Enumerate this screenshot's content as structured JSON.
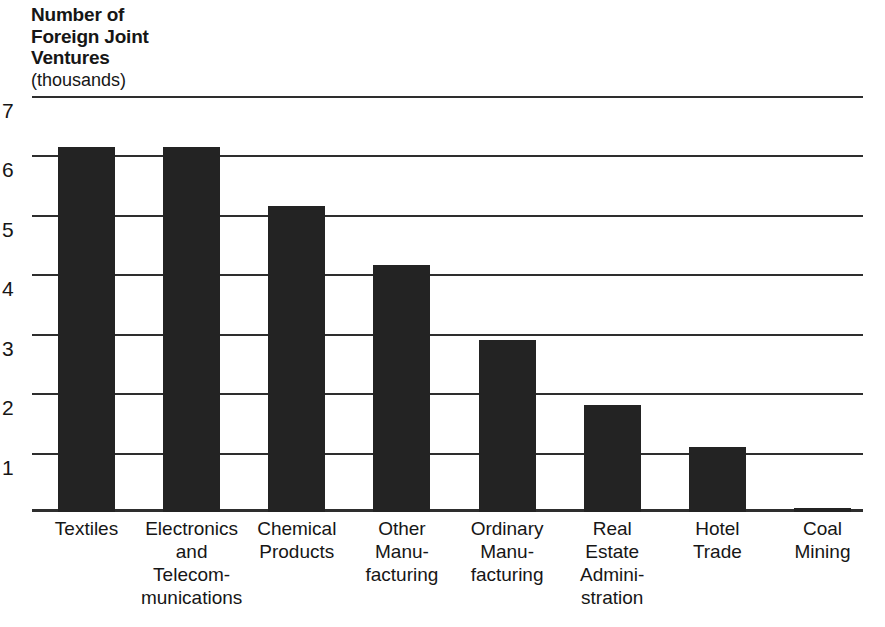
{
  "chart_data": {
    "type": "bar",
    "title": "Number of\nForeign Joint\nVentures",
    "subtitle": "(thousands)",
    "xlabel": "",
    "ylabel": "Number of Foreign Joint Ventures (thousands)",
    "ylim": [
      0,
      7
    ],
    "yticks": [
      7,
      6,
      5,
      4,
      3,
      2,
      1
    ],
    "ytick_labels": [
      "7",
      "6",
      "5",
      "4",
      "3",
      "2",
      "1"
    ],
    "grid": true,
    "legend": "none",
    "bar_color": "#232323",
    "axis_color": "#2e2e2e",
    "categories": [
      "Textiles",
      "Electronics\nand\nTelecom-\nmunications",
      "Chemical\nProducts",
      "Other\nManu-\nfacturing",
      "Ordinary\nManu-\nfacturing",
      "Real\nEstate\nAdmini-\nstration",
      "Hotel\nTrade",
      "Coal\nMining"
    ],
    "values": [
      6.15,
      6.15,
      5.15,
      4.15,
      2.9,
      1.8,
      1.1,
      0.05
    ]
  }
}
